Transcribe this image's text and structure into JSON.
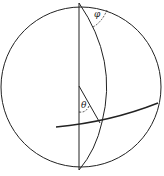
{
  "diagram": {
    "type": "sphere-spherical-coordinates",
    "labels": {
      "phi": "φ",
      "theta": "θ"
    },
    "colors": {
      "stroke": "#222222",
      "background": "#ffffff"
    }
  }
}
